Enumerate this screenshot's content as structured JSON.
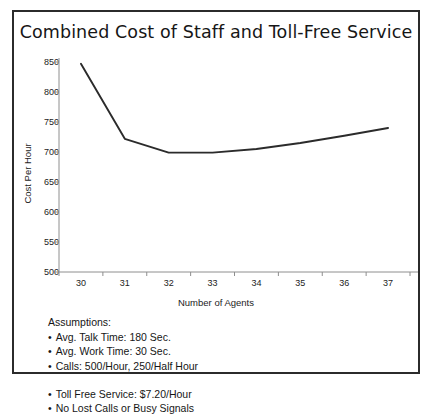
{
  "figure": {
    "title": "Combined Cost of Staff and Toll-Free Service"
  },
  "chart_data": {
    "type": "line",
    "title": "Combined Cost of Staff and Toll-Free Service",
    "xlabel": "Number of Agents",
    "ylabel": "Cost Per Hour",
    "categories": [
      30,
      31,
      32,
      33,
      34,
      35,
      36,
      37
    ],
    "values": [
      847,
      722,
      699,
      699,
      705,
      715,
      727,
      740
    ],
    "series": [
      {
        "name": "Combined Cost",
        "values": [
          847,
          722,
          699,
          699,
          705,
          715,
          727,
          740
        ],
        "color": "#2b2b2b"
      }
    ],
    "xtick_labels": [
      "30",
      "31",
      "32",
      "33",
      "34",
      "35",
      "36",
      "37"
    ],
    "ytick_labels": [
      "850",
      "800",
      "750",
      "700",
      "650",
      "600",
      "550",
      "500"
    ],
    "ytick_values": [
      850,
      800,
      750,
      700,
      650,
      600,
      550,
      500
    ],
    "ylim": [
      500,
      850
    ],
    "grid": false,
    "legend": false
  },
  "assumptions": {
    "heading": "Assumptions:",
    "left": [
      "Avg. Talk Time: 180 Sec.",
      "Avg. Work Time: 30 Sec.",
      "Calls: 500/Hour, 250/Half Hour"
    ],
    "right": [
      "Toll Free Service: $7.20/Hour",
      "No Lost Calls or Busy Signals"
    ]
  }
}
